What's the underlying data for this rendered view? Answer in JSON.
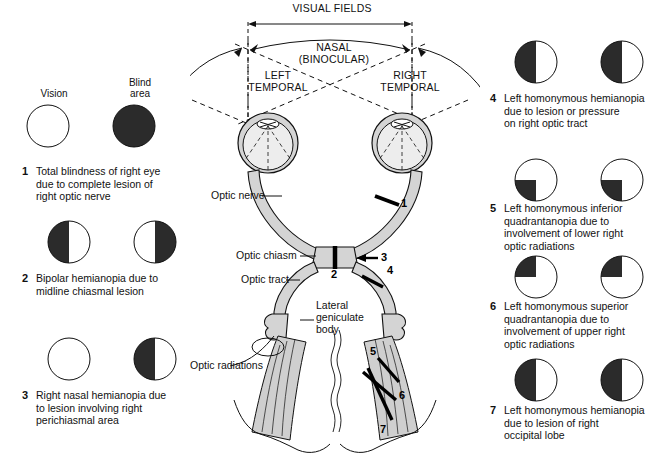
{
  "diagram": {
    "title_top": "VISUAL FIELDS",
    "legend": {
      "vision": "Vision",
      "blind": "Blind area",
      "vision_l1": "Vision",
      "blind_l1": "Blind",
      "blind_l2": "area"
    },
    "field_labels": {
      "nasal_1": "NASAL",
      "nasal_2": "(BINOCULAR)",
      "left_1": "LEFT",
      "left_2": "TEMPORAL",
      "right_1": "RIGHT",
      "right_2": "TEMPORAL"
    },
    "anatomy_labels": {
      "optic_nerve": "Optic nerve",
      "optic_chiasm": "Optic chiasm",
      "optic_tract": "Optic tract",
      "lateral_geniculate_1": "Lateral",
      "lateral_geniculate_2": "geniculate",
      "lateral_geniculate_3": "body",
      "optic_radiations": "Optic radiations"
    },
    "lesion_marks": [
      "1",
      "2",
      "3",
      "4",
      "5",
      "6",
      "7"
    ],
    "colors": {
      "blind": "#2b2b2b",
      "outline": "#111111",
      "pathway_fill": "#d4d4d4",
      "eye_fill": "#e8e8e8",
      "radiation_fill": "#cccccc",
      "background": "#ffffff"
    }
  },
  "left_column": [
    {
      "number": "1",
      "text": "Total blindness of right eye due to complete lesion of right optic nerve",
      "lines": [
        "Total blindness of right eye",
        "due to complete lesion of",
        "right optic nerve"
      ],
      "left_eye_pattern": "none",
      "right_eye_pattern": "full"
    },
    {
      "number": "2",
      "text": "Bipolar hemianopia due to midline chiasmal lesion",
      "lines": [
        "Bipolar hemianopia due to",
        "midline chiasmal lesion"
      ],
      "left_eye_pattern": "left-half",
      "right_eye_pattern": "right-half"
    },
    {
      "number": "3",
      "text": "Right nasal hemianopia due to lesion involving right perichiasmal area",
      "lines": [
        "Right nasal hemianopia due",
        "to lesion involving right",
        "perichiasmal area"
      ],
      "left_eye_pattern": "none",
      "right_eye_pattern": "left-half"
    }
  ],
  "right_column": [
    {
      "number": "4",
      "text": "Left homonymous hemianopia due to lesion or pressure on right optic tract",
      "lines": [
        "Left homonymous hemianopia",
        "due to lesion or pressure",
        "on right optic tract"
      ],
      "left_eye_pattern": "left-half",
      "right_eye_pattern": "left-half"
    },
    {
      "number": "5",
      "text": "Left homonymous inferior quadrantanopia due to involvement of lower right optic radiations",
      "lines": [
        "Left homonymous inferior",
        "quadrantanopia due to",
        "involvement of lower right",
        "optic radiations"
      ],
      "left_eye_pattern": "lower-left-quad",
      "right_eye_pattern": "lower-left-quad"
    },
    {
      "number": "6",
      "text": "Left homonymous superior quadrantanopia due to involvement of upper right optic radiations",
      "lines": [
        "Left homonymous superior",
        "quadrantanopia due to",
        "involvement of upper right",
        "optic radiations"
      ],
      "left_eye_pattern": "upper-left-quad",
      "right_eye_pattern": "upper-left-quad"
    },
    {
      "number": "7",
      "text": "Left homonymous hemianopia due to lesion of right occipital lobe",
      "lines": [
        "Left homonymous hemianopia",
        "due to lesion of right",
        "occipital lobe"
      ],
      "left_eye_pattern": "left-half",
      "right_eye_pattern": "left-half"
    }
  ]
}
